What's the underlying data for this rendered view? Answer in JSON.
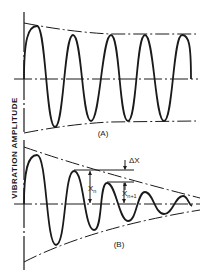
{
  "figure": {
    "y_axis_label": "VIBRATION AMPLITUDE",
    "panels": [
      {
        "id": "A",
        "label": "(A)",
        "description": "Sustained oscillation with initial overshoot"
      },
      {
        "id": "B",
        "label": "(B)",
        "description": "Damped oscillation with decaying envelope"
      }
    ],
    "annotations": {
      "delta_x": "ΔX",
      "x_n": "X",
      "x_n_sub": "n",
      "x_n1": "X",
      "x_n1_sub": "n+1"
    },
    "colors": {
      "line": "#1a1a1a",
      "background": "#ffffff"
    }
  }
}
